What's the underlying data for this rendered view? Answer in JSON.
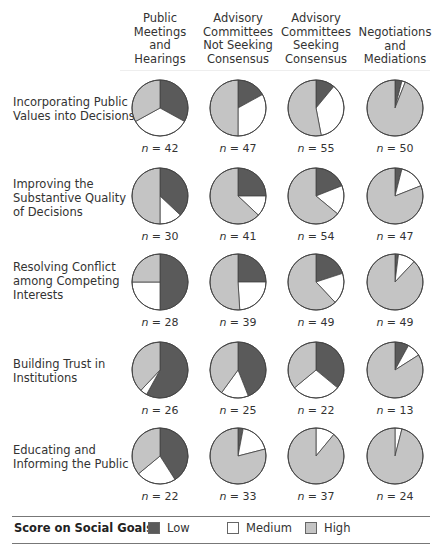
{
  "chart_data": {
    "type": "pie",
    "title": "",
    "legend": {
      "title": "Score on Social Goals",
      "position": "bottom",
      "entries": [
        {
          "label": "Low",
          "color": "#5a5a5a"
        },
        {
          "label": "Medium",
          "color": "#ffffff"
        },
        {
          "label": "High",
          "color": "#c4c4c4"
        }
      ]
    },
    "columns": [
      {
        "label_lines": [
          "Public",
          "Meetings",
          "and",
          "Hearings"
        ]
      },
      {
        "label_lines": [
          "Advisory",
          "Committees",
          "Not Seeking",
          "Consensus"
        ]
      },
      {
        "label_lines": [
          "Advisory",
          "Committees",
          "Seeking",
          "Consensus"
        ]
      },
      {
        "label_lines": [
          "Negotiations",
          "and",
          "Mediations"
        ]
      }
    ],
    "rows": [
      {
        "label_lines": [
          "Incorporating Public",
          "Values into Decisions"
        ],
        "pies": [
          {
            "n": "n = 42",
            "values": {
              "Low": 33,
              "Medium": 34,
              "High": 33
            }
          },
          {
            "n": "n = 47",
            "values": {
              "Low": 17,
              "Medium": 33,
              "High": 50
            }
          },
          {
            "n": "n = 55",
            "values": {
              "Low": 11,
              "Medium": 36,
              "High": 53
            }
          },
          {
            "n": "n = 50",
            "values": {
              "Low": 4,
              "Medium": 2,
              "High": 94
            }
          }
        ]
      },
      {
        "label_lines": [
          "Improving the",
          "Substantive Quality",
          "of Decisions"
        ],
        "pies": [
          {
            "n": "n = 30",
            "values": {
              "Low": 37,
              "Medium": 13,
              "High": 50
            }
          },
          {
            "n": "n = 41",
            "values": {
              "Low": 25,
              "Medium": 12,
              "High": 63
            }
          },
          {
            "n": "n = 54",
            "values": {
              "Low": 19,
              "Medium": 17,
              "High": 64
            }
          },
          {
            "n": "n = 47",
            "values": {
              "Low": 4,
              "Medium": 15,
              "High": 81
            }
          }
        ]
      },
      {
        "label_lines": [
          "Resolving Conflict",
          "among Competing",
          "Interests"
        ],
        "pies": [
          {
            "n": "n = 28",
            "values": {
              "Low": 50,
              "Medium": 25,
              "High": 25
            }
          },
          {
            "n": "n = 39",
            "values": {
              "Low": 25,
              "Medium": 24,
              "High": 51
            }
          },
          {
            "n": "n = 49",
            "values": {
              "Low": 20,
              "Medium": 18,
              "High": 62
            }
          },
          {
            "n": "n = 49",
            "values": {
              "Low": 2,
              "Medium": 10,
              "High": 88
            }
          }
        ]
      },
      {
        "label_lines": [
          "Building Trust in",
          "Institutions"
        ],
        "pies": [
          {
            "n": "n = 26",
            "values": {
              "Low": 58,
              "Medium": 4,
              "High": 38
            }
          },
          {
            "n": "n = 25",
            "values": {
              "Low": 44,
              "Medium": 16,
              "High": 40
            }
          },
          {
            "n": "n = 22",
            "values": {
              "Low": 36,
              "Medium": 28,
              "High": 36
            }
          },
          {
            "n": "n = 13",
            "values": {
              "Low": 8,
              "Medium": 8,
              "High": 84
            }
          }
        ]
      },
      {
        "label_lines": [
          "Educating and",
          "Informing the Public"
        ],
        "pies": [
          {
            "n": "n = 22",
            "values": {
              "Low": 41,
              "Medium": 23,
              "High": 36
            }
          },
          {
            "n": "n = 33",
            "values": {
              "Low": 3,
              "Medium": 18,
              "High": 79
            }
          },
          {
            "n": "n = 37",
            "values": {
              "Low": 0,
              "Medium": 11,
              "High": 89
            }
          },
          {
            "n": "n = 24",
            "values": {
              "Low": 0,
              "Medium": 4,
              "High": 96
            }
          }
        ]
      }
    ],
    "slice_order": [
      "Low",
      "Medium",
      "High"
    ],
    "slice_direction": "clockwise from 12 o'clock",
    "units": "percent of cases (estimated)"
  }
}
